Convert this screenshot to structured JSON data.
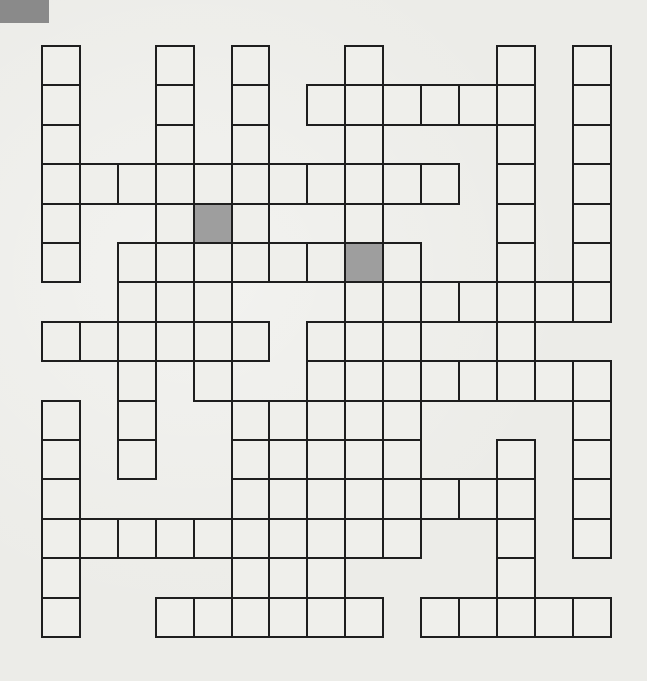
{
  "puzzle": {
    "type": "crossword-grid",
    "rows": 15,
    "cols": 15,
    "origin_x": 42,
    "origin_y": 46,
    "cell_w": 37.9,
    "cell_h": 39.4,
    "colors": {
      "cell_fill": "#efefeb",
      "shaded_fill": "#9e9e9e",
      "border": "#1e1e1e",
      "paper": "#ecece8",
      "corner_mark": "#8a8a8a"
    },
    "grid_rows": [
      {
        "row": 0,
        "cells": [
          0,
          3,
          5,
          8,
          12,
          14
        ]
      },
      {
        "row": 1,
        "cells": [
          0,
          3,
          5,
          7,
          8,
          9,
          10,
          11,
          12,
          14
        ]
      },
      {
        "row": 2,
        "cells": [
          0,
          3,
          5,
          8,
          12,
          14
        ]
      },
      {
        "row": 3,
        "cells": [
          0,
          1,
          2,
          3,
          4,
          5,
          6,
          7,
          8,
          9,
          10,
          12,
          14
        ]
      },
      {
        "row": 4,
        "cells": [
          0,
          3,
          4,
          5,
          8,
          12,
          14
        ]
      },
      {
        "row": 5,
        "cells": [
          0,
          2,
          3,
          4,
          5,
          6,
          7,
          8,
          9,
          12,
          14
        ]
      },
      {
        "row": 6,
        "cells": [
          2,
          3,
          4,
          8,
          9,
          10,
          11,
          12,
          13,
          14
        ]
      },
      {
        "row": 7,
        "cells": [
          0,
          1,
          2,
          3,
          4,
          5,
          7,
          8,
          9,
          12
        ]
      },
      {
        "row": 8,
        "cells": [
          2,
          4,
          7,
          8,
          9,
          10,
          11,
          12,
          13,
          14
        ]
      },
      {
        "row": 9,
        "cells": [
          0,
          2,
          5,
          6,
          7,
          8,
          9,
          14
        ]
      },
      {
        "row": 10,
        "cells": [
          0,
          2,
          5,
          6,
          7,
          8,
          9,
          12,
          14
        ]
      },
      {
        "row": 11,
        "cells": [
          0,
          5,
          6,
          7,
          8,
          9,
          10,
          11,
          12,
          14
        ]
      },
      {
        "row": 12,
        "cells": [
          0,
          1,
          2,
          3,
          4,
          5,
          6,
          7,
          8,
          9,
          12,
          14
        ]
      },
      {
        "row": 13,
        "cells": [
          0,
          5,
          6,
          7,
          12
        ]
      },
      {
        "row": 14,
        "cells": [
          0,
          3,
          4,
          5,
          6,
          7,
          8,
          10,
          11,
          12,
          13,
          14
        ]
      }
    ],
    "shaded_cells": [
      {
        "row": 4,
        "col": 4
      },
      {
        "row": 5,
        "col": 8
      }
    ]
  }
}
